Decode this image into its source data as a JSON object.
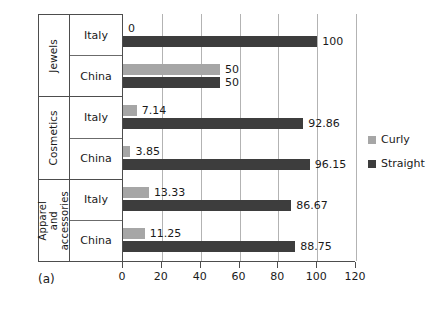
{
  "caption": "(a)",
  "legend": {
    "position": "right",
    "items": [
      {
        "label": "Curly",
        "color": "#a6a6a6"
      },
      {
        "label": "Straight",
        "color": "#3d3d3d"
      }
    ]
  },
  "axis": {
    "ticks": [
      "0",
      "20",
      "40",
      "60",
      "80",
      "100",
      "120"
    ]
  },
  "groups": [
    {
      "name": "Jewels",
      "rows": [
        {
          "country": "Italy",
          "curly": "0",
          "straight": "100"
        },
        {
          "country": "China",
          "curly": "50",
          "straight": "50"
        }
      ]
    },
    {
      "name": "Cosmetics",
      "rows": [
        {
          "country": "Italy",
          "curly": "7.14",
          "straight": "92.86"
        },
        {
          "country": "China",
          "curly": "3.85",
          "straight": "96.15"
        }
      ]
    },
    {
      "name": "Apparel and accessories",
      "rows": [
        {
          "country": "Italy",
          "curly": "13.33",
          "straight": "86.67"
        },
        {
          "country": "China",
          "curly": "11.25",
          "straight": "88.75"
        }
      ]
    }
  ],
  "chart_data": {
    "type": "bar",
    "orientation": "horizontal",
    "title": "",
    "subtitle": "",
    "xlabel": "",
    "ylabel": "",
    "xlim": [
      0,
      120
    ],
    "xticks": [
      0,
      20,
      40,
      60,
      80,
      100,
      120
    ],
    "grid": true,
    "legend_position": "right",
    "annotations": [
      "(a)"
    ],
    "categories": [
      "Jewels - Italy",
      "Jewels - China",
      "Cosmetics - Italy",
      "Cosmetics - China",
      "Apparel and accessories - Italy",
      "Apparel and accessories - China"
    ],
    "group_labels": [
      "Jewels",
      "Cosmetics",
      "Apparel and accessories"
    ],
    "country_labels": [
      "Italy",
      "China"
    ],
    "series": [
      {
        "name": "Curly",
        "color": "#a6a6a6",
        "values": [
          0,
          50,
          7.14,
          3.85,
          13.33,
          11.25
        ]
      },
      {
        "name": "Straight",
        "color": "#3d3d3d",
        "values": [
          100,
          50,
          92.86,
          96.15,
          86.67,
          88.75
        ]
      }
    ],
    "data_labels": {
      "Curly": [
        "0",
        "50",
        "7.14",
        "3.85",
        "13.33",
        "11.25"
      ],
      "Straight": [
        "100",
        "50",
        "92.86",
        "96.15",
        "86.67",
        "88.75"
      ]
    }
  }
}
